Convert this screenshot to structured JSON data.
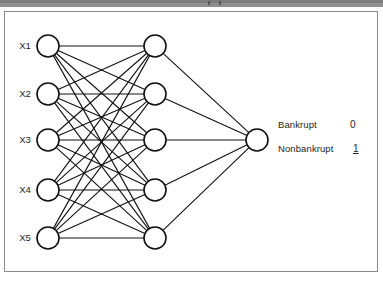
{
  "figure": {
    "type": "neural-network-diagram"
  },
  "colors": {
    "node_stroke": "#111111",
    "edge": "#111111",
    "node_fill": "#ffffff",
    "frame_border": "#8a8a8a",
    "page_background": "#ffffff",
    "top_bar": "#8e8e8e",
    "text": "#1d1d1d"
  },
  "network": {
    "input_layer": {
      "label_prefix": "X",
      "nodes": [
        {
          "label": "X1",
          "cx": 48,
          "cy": 46
        },
        {
          "label": "X2",
          "cx": 48,
          "cy": 94
        },
        {
          "label": "X3",
          "cx": 48,
          "cy": 140
        },
        {
          "label": "X4",
          "cx": 48,
          "cy": 190
        },
        {
          "label": "X5",
          "cx": 48,
          "cy": 238
        }
      ],
      "radius": 11
    },
    "hidden_layer": {
      "nodes": [
        {
          "cx": 155,
          "cy": 46
        },
        {
          "cx": 155,
          "cy": 94
        },
        {
          "cx": 155,
          "cy": 140
        },
        {
          "cx": 155,
          "cy": 190
        },
        {
          "cx": 155,
          "cy": 238
        }
      ],
      "radius": 11
    },
    "output_layer": {
      "nodes": [
        {
          "cx": 257,
          "cy": 140
        }
      ],
      "radius": 11
    },
    "connections": {
      "input_to_hidden": "fully-connected",
      "hidden_to_output": "fully-connected",
      "input_to_hidden_count": 25,
      "hidden_to_output_count": 5
    }
  },
  "output_legend": {
    "rows": [
      {
        "name": "Bankrupt",
        "value": "0",
        "underlined": false
      },
      {
        "name": "Nonbankrupt",
        "value": "1",
        "underlined": true
      }
    ]
  }
}
